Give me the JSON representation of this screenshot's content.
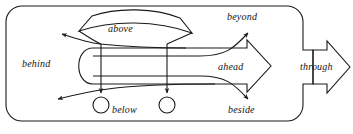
{
  "diagram": {
    "stroke_color": "#1a1a1a",
    "background_color": "#ffffff",
    "labels": [
      {
        "id": "above",
        "text": "above",
        "x": 122,
        "y": 28,
        "role": "curved-banner-label"
      },
      {
        "id": "beyond",
        "text": "beyond",
        "x": 231,
        "y": 17,
        "role": "upper-right-path-label"
      },
      {
        "id": "behind",
        "text": "behind",
        "x": 37,
        "y": 64,
        "role": "left-path-label"
      },
      {
        "id": "ahead",
        "text": "ahead",
        "x": 233,
        "y": 67,
        "role": "main-arrow-label"
      },
      {
        "id": "through",
        "text": "through",
        "x": 307,
        "y": 67,
        "role": "external-arrow-label"
      },
      {
        "id": "below",
        "text": "below",
        "x": 124,
        "y": 110,
        "role": "circles-label"
      },
      {
        "id": "beside",
        "text": "beside",
        "x": 240,
        "y": 110,
        "role": "lower-right-path-label"
      }
    ],
    "shapes": [
      {
        "id": "outer-boundary",
        "kind": "rounded-rectangle-with-notch"
      },
      {
        "id": "above-banner",
        "kind": "curved-banner"
      },
      {
        "id": "ahead-arrow",
        "kind": "block-arrow-right"
      },
      {
        "id": "through-arrow",
        "kind": "block-arrow-right"
      },
      {
        "id": "landmark-circle-left",
        "kind": "circle"
      },
      {
        "id": "landmark-circle-right",
        "kind": "circle"
      }
    ],
    "paths": [
      {
        "id": "behind-upper-path",
        "direction": "left",
        "arrowhead": true
      },
      {
        "id": "behind-lower-path",
        "direction": "left",
        "arrowhead": true
      },
      {
        "id": "beyond-path",
        "direction": "up-right",
        "arrowhead": true
      },
      {
        "id": "beside-path",
        "direction": "down-right",
        "arrowhead": true
      },
      {
        "id": "below-left-drop",
        "direction": "down",
        "arrowhead": true
      },
      {
        "id": "below-right-drop",
        "direction": "down",
        "arrowhead": true
      }
    ]
  }
}
